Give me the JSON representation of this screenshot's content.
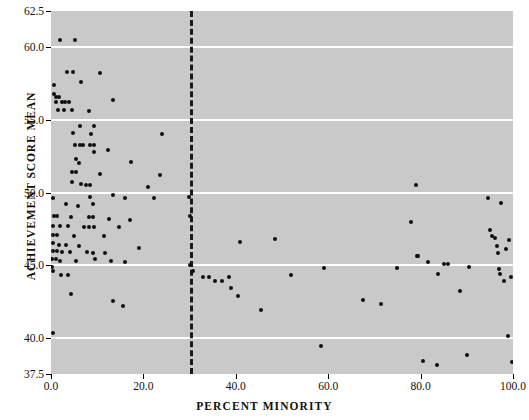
{
  "chart_data": {
    "type": "scatter",
    "title": "",
    "xlabel": "PERCENT MINORITY",
    "ylabel": "ACHIEVEMENT SCORE MEAN",
    "xlim": [
      0.0,
      100.0
    ],
    "ylim": [
      37.5,
      62.5
    ],
    "xticks": [
      0.0,
      20.0,
      40.0,
      60.0,
      80.0,
      100.0
    ],
    "xtick_labels": [
      "0.0",
      "20.0",
      "40.0",
      "60.0",
      "80.0",
      "100.0"
    ],
    "yticks": [
      37.5,
      40.0,
      45.0,
      50.0,
      55.0,
      60.0,
      62.5
    ],
    "ytick_labels": [
      "37.5",
      "40.0",
      "45.0",
      "50.0",
      "55.0",
      "60.0",
      "62.5"
    ],
    "gridlines_y": [
      40.0,
      45.0,
      50.0,
      55.0,
      60.0
    ],
    "grid": "horizontal-white",
    "legend": "none",
    "plot_background": "#c9c9c9",
    "marker_color": "#101010",
    "reference_line": {
      "orientation": "vertical",
      "x": 30.0,
      "style": "dashed",
      "color": "#1a1a1a"
    },
    "points": [
      [
        2.0,
        60.5
      ],
      [
        5.2,
        60.5
      ],
      [
        3.5,
        58.3
      ],
      [
        4.8,
        58.3
      ],
      [
        10.5,
        58.2
      ],
      [
        6.5,
        57.6
      ],
      [
        0.6,
        57.4
      ],
      [
        0.6,
        56.8
      ],
      [
        1.0,
        56.6
      ],
      [
        1.8,
        56.6
      ],
      [
        13.5,
        56.4
      ],
      [
        1.1,
        56.2
      ],
      [
        2.3,
        56.2
      ],
      [
        3.1,
        56.2
      ],
      [
        4.0,
        56.2
      ],
      [
        1.6,
        55.7
      ],
      [
        2.8,
        55.7
      ],
      [
        4.6,
        55.7
      ],
      [
        8.2,
        55.6
      ],
      [
        6.2,
        54.6
      ],
      [
        9.4,
        54.6
      ],
      [
        4.8,
        54.1
      ],
      [
        8.6,
        54.0
      ],
      [
        24.0,
        54.0
      ],
      [
        5.2,
        53.3
      ],
      [
        6.2,
        53.3
      ],
      [
        7.0,
        53.3
      ],
      [
        8.4,
        53.3
      ],
      [
        9.3,
        53.3
      ],
      [
        9.3,
        52.8
      ],
      [
        12.4,
        52.9
      ],
      [
        5.4,
        52.3
      ],
      [
        6.0,
        52.0
      ],
      [
        17.4,
        52.1
      ],
      [
        4.6,
        51.4
      ],
      [
        5.5,
        51.4
      ],
      [
        10.6,
        51.3
      ],
      [
        23.5,
        51.2
      ],
      [
        4.6,
        50.7
      ],
      [
        6.5,
        50.6
      ],
      [
        7.6,
        50.5
      ],
      [
        8.5,
        50.5
      ],
      [
        21.0,
        50.4
      ],
      [
        0.4,
        49.6
      ],
      [
        8.4,
        49.7
      ],
      [
        13.4,
        49.8
      ],
      [
        16.0,
        49.6
      ],
      [
        22.4,
        49.6
      ],
      [
        29.8,
        49.7
      ],
      [
        3.2,
        49.2
      ],
      [
        5.8,
        49.1
      ],
      [
        9.0,
        49.2
      ],
      [
        0.6,
        48.4
      ],
      [
        1.4,
        48.4
      ],
      [
        4.4,
        48.3
      ],
      [
        8.2,
        48.3
      ],
      [
        9.0,
        48.3
      ],
      [
        12.6,
        48.2
      ],
      [
        17.0,
        48.1
      ],
      [
        0.5,
        47.7
      ],
      [
        2.0,
        47.7
      ],
      [
        3.6,
        47.7
      ],
      [
        7.2,
        47.6
      ],
      [
        8.3,
        47.6
      ],
      [
        9.3,
        47.6
      ],
      [
        14.8,
        47.6
      ],
      [
        0.5,
        47.1
      ],
      [
        1.3,
        47.1
      ],
      [
        5.0,
        47.0
      ],
      [
        11.4,
        47.0
      ],
      [
        0.4,
        46.5
      ],
      [
        1.8,
        46.4
      ],
      [
        3.2,
        46.4
      ],
      [
        6.0,
        46.3
      ],
      [
        19.0,
        46.2
      ],
      [
        0.4,
        46.0
      ],
      [
        1.2,
        46.0
      ],
      [
        2.4,
        45.9
      ],
      [
        4.2,
        45.9
      ],
      [
        7.8,
        45.9
      ],
      [
        9.0,
        45.8
      ],
      [
        11.6,
        45.8
      ],
      [
        0.3,
        45.4
      ],
      [
        1.0,
        45.4
      ],
      [
        2.0,
        45.3
      ],
      [
        5.4,
        45.3
      ],
      [
        9.6,
        45.4
      ],
      [
        13.0,
        45.3
      ],
      [
        16.0,
        45.2
      ],
      [
        0.3,
        44.9
      ],
      [
        0.4,
        44.6
      ],
      [
        2.2,
        44.3
      ],
      [
        3.6,
        44.3
      ],
      [
        4.4,
        43.0
      ],
      [
        13.4,
        42.5
      ],
      [
        15.6,
        42.2
      ],
      [
        0.4,
        40.3
      ],
      [
        30.0,
        48.4
      ],
      [
        30.0,
        45.0
      ],
      [
        30.8,
        44.6
      ],
      [
        33.0,
        44.2
      ],
      [
        34.2,
        44.2
      ],
      [
        35.4,
        43.9
      ],
      [
        37.0,
        43.9
      ],
      [
        38.6,
        44.2
      ],
      [
        39.0,
        43.4
      ],
      [
        40.4,
        42.9
      ],
      [
        41.0,
        46.6
      ],
      [
        45.5,
        41.9
      ],
      [
        48.5,
        46.8
      ],
      [
        52.0,
        44.3
      ],
      [
        58.5,
        39.4
      ],
      [
        59.0,
        44.8
      ],
      [
        67.5,
        42.6
      ],
      [
        71.5,
        42.3
      ],
      [
        74.8,
        44.8
      ],
      [
        78.0,
        48.0
      ],
      [
        79.0,
        50.5
      ],
      [
        79.3,
        45.6
      ],
      [
        79.5,
        45.6
      ],
      [
        80.5,
        38.4
      ],
      [
        81.6,
        45.2
      ],
      [
        83.5,
        38.1
      ],
      [
        83.8,
        44.4
      ],
      [
        85.0,
        45.1
      ],
      [
        86.0,
        45.1
      ],
      [
        88.5,
        43.2
      ],
      [
        90.0,
        38.8
      ],
      [
        90.5,
        44.9
      ],
      [
        94.5,
        49.6
      ],
      [
        95.0,
        47.4
      ],
      [
        95.5,
        47.0
      ],
      [
        96.0,
        46.9
      ],
      [
        96.5,
        46.3
      ],
      [
        96.8,
        45.8
      ],
      [
        97.0,
        44.7
      ],
      [
        97.2,
        44.4
      ],
      [
        97.5,
        49.3
      ],
      [
        98.0,
        43.9
      ],
      [
        98.5,
        46.1
      ],
      [
        99.0,
        40.1
      ],
      [
        99.2,
        46.7
      ],
      [
        99.5,
        44.2
      ],
      [
        99.8,
        38.3
      ]
    ]
  }
}
